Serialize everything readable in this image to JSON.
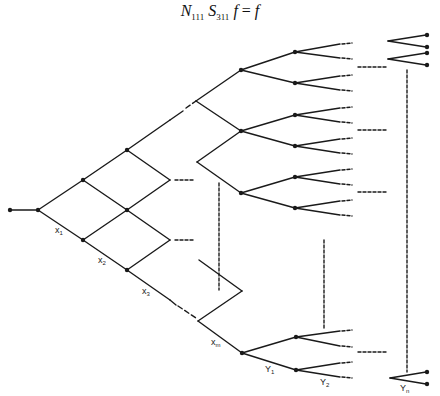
{
  "formula": {
    "N_sub": "111",
    "S_sub": "311",
    "lhs_f": "f",
    "equals": "=",
    "rhs": "f"
  },
  "labels": {
    "x1": {
      "base": "x",
      "sub": "1"
    },
    "x2": {
      "base": "x",
      "sub": "2"
    },
    "x3": {
      "base": "x",
      "sub": "3"
    },
    "xm": {
      "base": "x",
      "sub": "m"
    },
    "y1": {
      "base": "Y",
      "sub": "1"
    },
    "y2": {
      "base": "Y",
      "sub": "2"
    },
    "yn": {
      "base": "Y",
      "sub": "n"
    }
  },
  "colors": {
    "line": "#1a1a1a",
    "background": "#ffffff"
  }
}
